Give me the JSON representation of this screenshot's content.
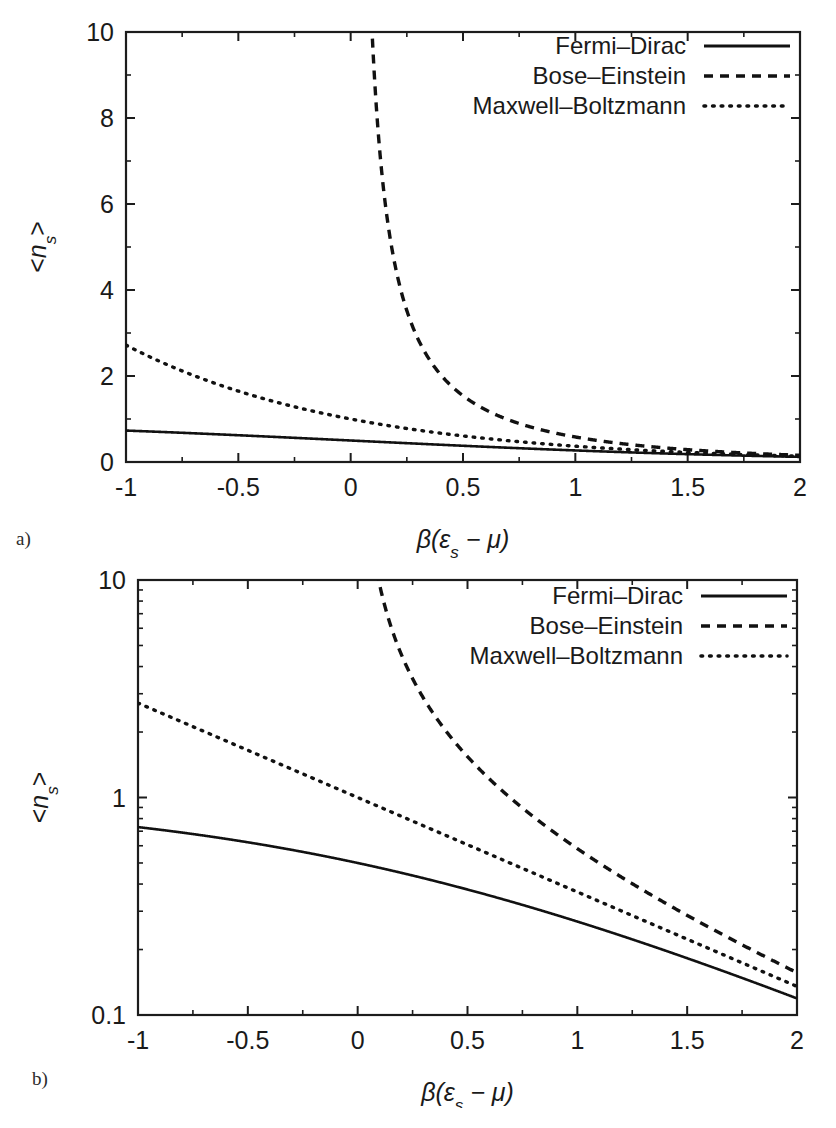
{
  "figure": {
    "panel_a_label": "a)",
    "panel_b_label": "b)"
  },
  "legend": {
    "position": "top-right",
    "entries": [
      {
        "label": "Fermi–Dirac",
        "style": "solid"
      },
      {
        "label": "Bose–Einstein",
        "style": "dashed"
      },
      {
        "label": "Maxwell–Boltzmann",
        "style": "dotted"
      }
    ]
  },
  "axis_titles": {
    "x": "β(ε",
    "x_sub": "s",
    "x_tail": " − μ)",
    "y_open": "<",
    "y_main": "n",
    "y_sub": "s",
    "y_close": ">"
  },
  "chart_data": [
    {
      "type": "line",
      "panel": "a",
      "title": "",
      "xlabel": "β(ε_s − μ)",
      "ylabel": "<n_s>",
      "xlim": [
        -1,
        2
      ],
      "ylim": [
        0,
        10
      ],
      "yscale": "linear",
      "grid": false,
      "xticks": [
        -1,
        -0.5,
        0,
        0.5,
        1,
        1.5,
        2
      ],
      "xticklabels": [
        "-1",
        "-0.5",
        "0",
        "0.5",
        "1",
        "1.5",
        "2"
      ],
      "yticks": [
        0,
        2,
        4,
        6,
        8,
        10
      ],
      "yticklabels": [
        "0",
        "2",
        "4",
        "6",
        "8",
        "10"
      ],
      "legend_position": "upper right",
      "series": [
        {
          "name": "Fermi–Dirac",
          "style": "solid",
          "formula": "1/(exp(x)+1)",
          "x": [
            -1,
            -0.75,
            -0.5,
            -0.25,
            0,
            0.25,
            0.5,
            0.75,
            1,
            1.25,
            1.5,
            1.75,
            2
          ],
          "values": [
            0.731,
            0.679,
            0.622,
            0.562,
            0.5,
            0.438,
            0.378,
            0.321,
            0.269,
            0.223,
            0.182,
            0.148,
            0.119
          ]
        },
        {
          "name": "Bose–Einstein",
          "style": "dashed",
          "formula": "1/(exp(x)-1)",
          "x": [
            0.0953,
            0.15,
            0.25,
            0.5,
            0.75,
            1,
            1.25,
            1.5,
            1.75,
            2
          ],
          "values": [
            10.0,
            6.17,
            3.52,
            1.541,
            0.888,
            0.582,
            0.403,
            0.29,
            0.214,
            0.156
          ]
        },
        {
          "name": "Maxwell–Boltzmann",
          "style": "dotted",
          "formula": "exp(-x)",
          "x": [
            -1,
            -0.75,
            -0.5,
            -0.25,
            0,
            0.25,
            0.5,
            0.75,
            1,
            1.25,
            1.5,
            1.75,
            2
          ],
          "values": [
            2.718,
            2.117,
            1.649,
            1.284,
            1.0,
            0.779,
            0.607,
            0.472,
            0.368,
            0.287,
            0.223,
            0.174,
            0.135
          ]
        }
      ]
    },
    {
      "type": "line",
      "panel": "b",
      "title": "",
      "xlabel": "β(ε_s − μ)",
      "ylabel": "<n_s>",
      "xlim": [
        -1,
        2
      ],
      "ylim": [
        0.1,
        10
      ],
      "yscale": "log",
      "grid": false,
      "xticks": [
        -1,
        -0.5,
        0,
        0.5,
        1,
        1.5,
        2
      ],
      "xticklabels": [
        "-1",
        "-0.5",
        "0",
        "0.5",
        "1",
        "1.5",
        "2"
      ],
      "yticks": [
        0.1,
        1,
        10
      ],
      "yticklabels": [
        "0.1",
        "1",
        "10"
      ],
      "legend_position": "upper right",
      "series": [
        {
          "name": "Fermi–Dirac",
          "style": "solid",
          "formula": "1/(exp(x)+1)",
          "x": [
            -1,
            -0.75,
            -0.5,
            -0.25,
            0,
            0.25,
            0.5,
            0.75,
            1,
            1.25,
            1.5,
            1.75,
            2
          ],
          "values": [
            0.731,
            0.679,
            0.622,
            0.562,
            0.5,
            0.438,
            0.378,
            0.321,
            0.269,
            0.223,
            0.182,
            0.148,
            0.119
          ]
        },
        {
          "name": "Bose–Einstein",
          "style": "dashed",
          "formula": "1/(exp(x)-1)",
          "x": [
            0.0953,
            0.15,
            0.25,
            0.5,
            0.75,
            1,
            1.25,
            1.5,
            1.75,
            2
          ],
          "values": [
            10.0,
            6.17,
            3.52,
            1.541,
            0.888,
            0.582,
            0.403,
            0.29,
            0.214,
            0.156
          ]
        },
        {
          "name": "Maxwell–Boltzmann",
          "style": "dotted",
          "formula": "exp(-x)",
          "x": [
            -1,
            -0.75,
            -0.5,
            -0.25,
            0,
            0.25,
            0.5,
            0.75,
            1,
            1.25,
            1.5,
            1.75,
            2
          ],
          "values": [
            2.718,
            2.117,
            1.649,
            1.284,
            1.0,
            0.779,
            0.607,
            0.472,
            0.368,
            0.287,
            0.223,
            0.174,
            0.135
          ]
        }
      ]
    }
  ]
}
